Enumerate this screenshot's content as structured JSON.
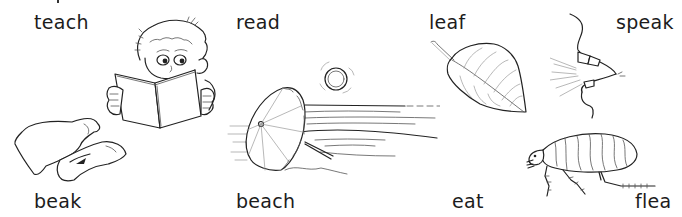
{
  "worksheet": {
    "words": [
      {
        "id": "teach",
        "text": "teach",
        "row": "top"
      },
      {
        "id": "read",
        "text": "read",
        "row": "top"
      },
      {
        "id": "leaf",
        "text": "leaf",
        "row": "top"
      },
      {
        "id": "speak",
        "text": "speak",
        "row": "top"
      },
      {
        "id": "beak",
        "text": "beak",
        "row": "bottom"
      },
      {
        "id": "beach",
        "text": "beach",
        "row": "bottom"
      },
      {
        "id": "eat",
        "text": "eat",
        "row": "bottom"
      },
      {
        "id": "flea",
        "text": "flea",
        "row": "bottom"
      }
    ],
    "pictures": [
      {
        "id": "boy-reading",
        "icon": "boy-reading-book-icon"
      },
      {
        "id": "bird-beak",
        "icon": "beak-icon"
      },
      {
        "id": "beach-umbrella",
        "icon": "beach-umbrella-sun-icon"
      },
      {
        "id": "leaf",
        "icon": "leaf-icon"
      },
      {
        "id": "speaking-mouth",
        "icon": "speaking-mouth-icon"
      },
      {
        "id": "flea",
        "icon": "flea-icon"
      }
    ]
  }
}
